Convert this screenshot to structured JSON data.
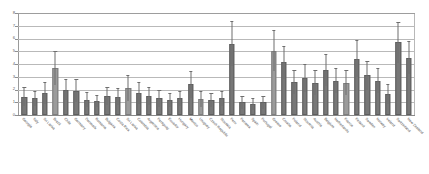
{
  "chart_data": {
    "type": "bar",
    "title": "",
    "subtitle": "",
    "xlabel": "",
    "ylabel": "",
    "ylim": [
      0,
      8
    ],
    "yticks": [
      0,
      1,
      2,
      3,
      4,
      5,
      6,
      7,
      8
    ],
    "ytick_labels": [
      "0",
      "1",
      "2",
      "3",
      "4",
      "5",
      "6",
      "7",
      "8"
    ],
    "grid": "horizontal",
    "legend": "none",
    "error_bars": "yes",
    "bar_color": "#777777",
    "error_color": "#6e6e6e",
    "grid_color": "#b9b9b9",
    "axis_color": "#8f8f8f",
    "categories": [
      "Georgia",
      "Italy",
      "Sri Lanka",
      "Brazil",
      "Chile",
      "Germany",
      "Denmark",
      "Romania",
      "Bulgaria",
      "Costa Rica",
      "Sri Lanka",
      "Colombia",
      "Argentina",
      "Paraguay",
      "Ecuador",
      "Hungary",
      "Mexico",
      "Uruguay",
      "Czech Republic",
      "Slovakia",
      "Peru",
      "Panama",
      "Spain",
      "Portugal",
      "Greece",
      "Croatia",
      "Poland",
      "Slovenia",
      "Austria",
      "Belgium",
      "Netherlands",
      "France",
      "Finland",
      "Sweden",
      "Norway",
      "Ireland",
      "Switzerland",
      "New Zealand"
    ],
    "values": [
      1.45,
      1.3,
      1.75,
      3.7,
      2.0,
      1.9,
      1.2,
      1.1,
      1.5,
      1.45,
      2.1,
      1.75,
      1.5,
      1.3,
      1.2,
      1.3,
      2.4,
      1.25,
      1.2,
      1.3,
      5.6,
      1.0,
      0.85,
      1.0,
      5.05,
      4.15,
      2.6,
      2.9,
      2.55,
      3.55,
      2.7,
      2.55,
      4.4,
      3.1,
      2.7,
      1.65,
      5.7,
      4.5
    ],
    "errors_upper": [
      0.75,
      0.6,
      0.85,
      1.35,
      0.85,
      0.9,
      0.6,
      0.5,
      0.7,
      0.7,
      1.0,
      0.85,
      0.7,
      0.65,
      0.55,
      0.6,
      1.05,
      0.6,
      0.55,
      0.6,
      1.75,
      0.5,
      0.45,
      0.5,
      1.6,
      1.3,
      0.95,
      1.1,
      0.95,
      1.25,
      1.0,
      0.95,
      1.45,
      1.15,
      1.0,
      0.8,
      1.6,
      1.3
    ]
  },
  "axis": {
    "y_top_label": "8",
    "y_bottom_label": "0"
  }
}
